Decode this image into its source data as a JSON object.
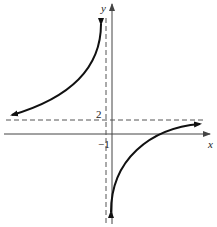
{
  "graph": {
    "type": "rational-function-sketch",
    "axes": {
      "x_label": "x",
      "y_label": "y"
    },
    "asymptotes": {
      "vertical": {
        "value": "-1",
        "label": "−1",
        "style": "dashed"
      },
      "horizontal": {
        "value": "2",
        "label": "2",
        "style": "dashed"
      }
    },
    "branches": [
      {
        "name": "upper-left",
        "description": "approaches y=2 from above as x→−∞, rises to +∞ as x→−1⁻"
      },
      {
        "name": "lower-right",
        "description": "descends to −∞ as x→−1⁺, approaches y=2 from below as x→+∞, crosses x-axis"
      }
    ],
    "colors": {
      "curve": "#111111",
      "axes": "#444444",
      "asymptote": "#555555"
    }
  }
}
